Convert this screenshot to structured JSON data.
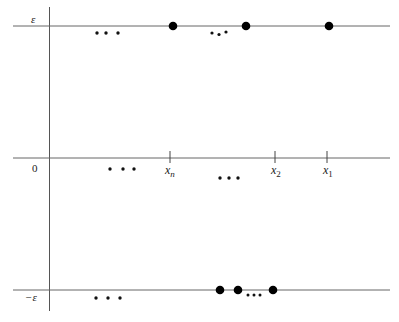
{
  "figure": {
    "labels": {
      "epsilon": "ε",
      "neg_epsilon": "−ε",
      "zero": "0",
      "ellipsis": "• • •"
    },
    "axis_labels": [
      {
        "name": "x_n",
        "base": "x",
        "sub": "n",
        "x": 170
      },
      {
        "name": "x_2",
        "base": "x",
        "sub": "2",
        "x": 275
      },
      {
        "name": "x_1",
        "base": "x",
        "sub": "1",
        "x": 327
      }
    ],
    "top_line_points_x": [
      173,
      246,
      329
    ],
    "bottom_line_points_x": [
      220,
      237,
      273
    ],
    "colors": {
      "line": "#555555",
      "dot": "#000000"
    }
  }
}
